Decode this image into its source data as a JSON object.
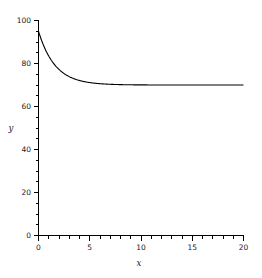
{
  "chart_data": {
    "type": "line",
    "title": "",
    "subtitle": "",
    "xlabel": "x",
    "ylabel": "y",
    "xlim": [
      0,
      20
    ],
    "ylim": [
      0,
      100
    ],
    "grid": false,
    "legend": null,
    "x_ticks": [
      0,
      5,
      10,
      15,
      20
    ],
    "x_tick_labels": [
      "0",
      "5",
      "10",
      "15",
      "20"
    ],
    "x_minor_step": 1,
    "y_ticks": [
      0,
      20,
      40,
      60,
      80,
      100
    ],
    "y_tick_labels": [
      "0",
      "20",
      "40",
      "60",
      "80",
      "100"
    ],
    "y_minor_step": 5,
    "series": [
      {
        "name": "decay",
        "color": "#000000",
        "asymptote": 70,
        "x": [
          0,
          0.25,
          0.5,
          0.75,
          1,
          1.25,
          1.5,
          1.75,
          2,
          2.5,
          3,
          3.5,
          4,
          4.5,
          5,
          5.5,
          6,
          6.5,
          7,
          7.5,
          8,
          9,
          10,
          11,
          12,
          13,
          14,
          15,
          16,
          17,
          18,
          19,
          20
        ],
        "y": [
          95,
          91.5,
          88.5,
          85.9,
          83.7,
          81.8,
          70.2,
          78.7,
          77.5,
          75.6,
          74.1,
          73.1,
          72.3,
          71.7,
          71.2,
          70.9,
          70.7,
          70.5,
          70.4,
          70.3,
          70.2,
          70.1,
          70.05,
          70.02,
          70.01,
          70,
          70,
          70,
          70,
          70,
          70,
          70,
          70
        ]
      }
    ]
  },
  "axis_labels": {
    "x": "x",
    "y": "y"
  }
}
